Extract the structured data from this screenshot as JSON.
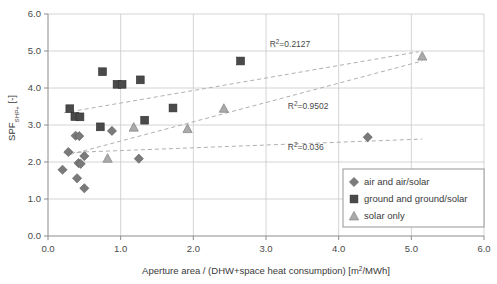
{
  "chart_data": {
    "type": "scatter",
    "title": "",
    "xlabel_parts": {
      "main": "Aperture area / (DHW+space heat consumption) [m",
      "sup": "2",
      "tail": "/MWh]"
    },
    "xlabel": "Aperture area / (DHW+space heat consumption) [m2/MWh]",
    "ylabel_parts": {
      "main": "SPF",
      "sub": "SHP+",
      "tail": " [-]"
    },
    "ylabel": "SPF_SHP+ [-]",
    "xlim": [
      0.0,
      6.0
    ],
    "ylim": [
      0.0,
      6.0
    ],
    "xticks": [
      "0.0",
      "1.0",
      "2.0",
      "3.0",
      "4.0",
      "5.0",
      "6.0"
    ],
    "yticks": [
      "0.0",
      "1.0",
      "2.0",
      "3.0",
      "4.0",
      "5.0",
      "6.0"
    ],
    "xtick_values": [
      0,
      1,
      2,
      3,
      4,
      5,
      6
    ],
    "ytick_values": [
      0,
      1,
      2,
      3,
      4,
      5,
      6
    ],
    "grid": true,
    "legend_position": "bottom-right",
    "series": [
      {
        "name": "air and air/solar",
        "marker": "diamond",
        "color": "#7a7a7a",
        "points": [
          [
            0.2,
            1.79
          ],
          [
            0.28,
            2.27
          ],
          [
            0.38,
            2.71
          ],
          [
            0.43,
            2.7
          ],
          [
            0.42,
            1.97
          ],
          [
            0.45,
            1.95
          ],
          [
            0.4,
            1.56
          ],
          [
            0.5,
            2.16
          ],
          [
            0.5,
            1.29
          ],
          [
            0.88,
            2.84
          ],
          [
            1.25,
            2.09
          ],
          [
            4.4,
            2.67
          ]
        ]
      },
      {
        "name": "ground and ground/solar",
        "marker": "square",
        "color": "#4a4a4a",
        "points": [
          [
            0.3,
            3.44
          ],
          [
            0.37,
            3.23
          ],
          [
            0.44,
            3.22
          ],
          [
            0.75,
            4.44
          ],
          [
            0.72,
            2.95
          ],
          [
            0.95,
            4.1
          ],
          [
            1.02,
            4.1
          ],
          [
            1.27,
            4.22
          ],
          [
            1.33,
            3.13
          ],
          [
            1.72,
            3.46
          ],
          [
            2.65,
            4.73
          ]
        ]
      },
      {
        "name": "solar only",
        "marker": "triangle",
        "color": "#aaaaaa",
        "points": [
          [
            0.82,
            2.1
          ],
          [
            1.18,
            2.94
          ],
          [
            1.92,
            2.9
          ],
          [
            2.42,
            3.45
          ],
          [
            5.15,
            4.86
          ]
        ]
      }
    ],
    "trendlines": [
      {
        "for": "ground and ground/solar",
        "r2_label": "R2=0.2127",
        "r2_value": 0.2127,
        "x0": 0.22,
        "y0": 3.33,
        "x1": 5.1,
        "y1": 4.98
      },
      {
        "for": "solar only",
        "r2_label": "R2=0.9502",
        "r2_value": 0.9502,
        "x0": 0.3,
        "y0": 2.2,
        "x1": 5.15,
        "y1": 4.73
      },
      {
        "for": "air and air/solar",
        "r2_label": "R2=0.036",
        "r2_value": 0.036,
        "x0": 0.22,
        "y0": 2.25,
        "x1": 5.15,
        "y1": 2.62
      }
    ],
    "annotations": [
      {
        "text_base": "R",
        "sup": "2",
        "text_rest": "=0.2127",
        "x": 3.05,
        "y": 5.1
      },
      {
        "text_base": "R",
        "sup": "2",
        "text_rest": "=0.9502",
        "x": 3.3,
        "y": 3.42
      },
      {
        "text_base": "R",
        "sup": "2",
        "text_rest": "=0.036",
        "x": 3.3,
        "y": 2.33
      }
    ],
    "legend_entries": [
      {
        "label": "air and air/solar",
        "marker": "diamond",
        "color": "#7a7a7a"
      },
      {
        "label": "ground and ground/solar",
        "marker": "square",
        "color": "#4a4a4a"
      },
      {
        "label": "solar only",
        "marker": "triangle",
        "color": "#aaaaaa"
      }
    ]
  },
  "colors": {
    "axis": "#8c8c8c",
    "grid": "#c9c9c9",
    "trendline": "#b0b0b0",
    "text": "#3a3a3a",
    "legend_border": "#8c8c8c",
    "diamond": "#7a7a7a",
    "square": "#4a4a4a",
    "triangle": "#aaaaaa"
  }
}
